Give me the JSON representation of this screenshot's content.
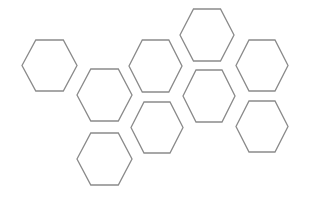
{
  "canvas": {
    "width": 309,
    "height": 198,
    "background": "#ffffff"
  },
  "style": {
    "stroke_color": "#8a8a8a",
    "stroke_width": 1.3,
    "fill": "none"
  },
  "hexagons": [
    {
      "id": "hex-1",
      "cx": 49.5,
      "cy": 65.5,
      "w": 55,
      "h": 51
    },
    {
      "id": "hex-2",
      "cx": 104.5,
      "cy": 95,
      "w": 55,
      "h": 52
    },
    {
      "id": "hex-3",
      "cx": 155.5,
      "cy": 66,
      "w": 53,
      "h": 52
    },
    {
      "id": "hex-4",
      "cx": 207,
      "cy": 35,
      "w": 54,
      "h": 52
    },
    {
      "id": "hex-5",
      "cx": 262,
      "cy": 65.5,
      "w": 52,
      "h": 51
    },
    {
      "id": "hex-6",
      "cx": 209,
      "cy": 96,
      "w": 52,
      "h": 52
    },
    {
      "id": "hex-7",
      "cx": 262,
      "cy": 126.5,
      "w": 52,
      "h": 51
    },
    {
      "id": "hex-8",
      "cx": 157,
      "cy": 127.5,
      "w": 52,
      "h": 51
    },
    {
      "id": "hex-9",
      "cx": 104.5,
      "cy": 159,
      "w": 55,
      "h": 52
    }
  ]
}
